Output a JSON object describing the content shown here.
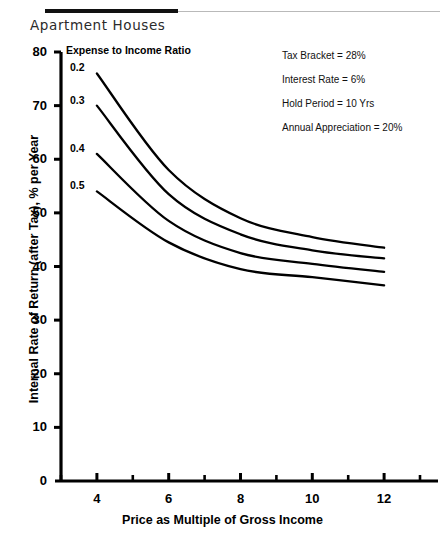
{
  "document": {
    "title": "Apartment Houses"
  },
  "chart_data": {
    "type": "line",
    "title": "Apartment Houses",
    "xlabel": "Price as Multiple of Gross Income",
    "ylabel": "Internal Rate of Return (after Tax), % per Year",
    "xlim": [
      3,
      13
    ],
    "ylim": [
      0,
      80
    ],
    "xticks": [
      4,
      6,
      8,
      10,
      12
    ],
    "xtick_labels": [
      "4",
      "6",
      "8",
      "10",
      "12"
    ],
    "yticks": [
      0,
      10,
      20,
      30,
      40,
      50,
      60,
      70,
      80
    ],
    "ytick_labels": [
      "0",
      "10",
      "20",
      "30",
      "40",
      "50",
      "60",
      "70",
      "80"
    ],
    "grid": false,
    "legend_title": "Expense to Income Ratio",
    "legend_position": "inline-left-of-curves",
    "x": [
      4,
      6,
      8,
      10,
      12
    ],
    "series": [
      {
        "name": "0.2",
        "label": "0.2",
        "values": [
          76.0,
          58.0,
          49.0,
          45.5,
          43.5
        ]
      },
      {
        "name": "0.3",
        "label": "0.3",
        "values": [
          70.0,
          53.5,
          46.0,
          43.0,
          41.5
        ]
      },
      {
        "name": "0.4",
        "label": "0.4",
        "values": [
          61.0,
          48.5,
          42.5,
          40.5,
          39.0
        ]
      },
      {
        "name": "0.5",
        "label": "0.5",
        "values": [
          54.0,
          44.5,
          39.5,
          38.0,
          36.5
        ]
      }
    ],
    "annotations": [
      "Tax Bracket = 28%",
      "Interest Rate = 6%",
      "Hold Period = 10 Yrs",
      "Annual Appreciation = 20%"
    ]
  }
}
